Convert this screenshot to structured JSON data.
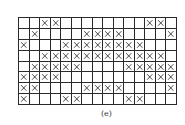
{
  "figure": {
    "caption": "(e)",
    "rows": 8,
    "cols": 15,
    "line_color": "#2a2a2a",
    "mark_icon": "x-mark-icon",
    "grid": [
      [
        0,
        0,
        1,
        1,
        0,
        0,
        0,
        0,
        0,
        0,
        0,
        0,
        1,
        1,
        0
      ],
      [
        0,
        1,
        0,
        0,
        0,
        0,
        1,
        1,
        1,
        1,
        0,
        0,
        0,
        0,
        1
      ],
      [
        1,
        0,
        0,
        0,
        1,
        1,
        1,
        1,
        1,
        1,
        1,
        1,
        0,
        0,
        0
      ],
      [
        0,
        0,
        1,
        1,
        1,
        1,
        1,
        1,
        1,
        1,
        1,
        1,
        1,
        1,
        0
      ],
      [
        0,
        1,
        1,
        1,
        1,
        1,
        0,
        0,
        0,
        0,
        1,
        1,
        1,
        1,
        1
      ],
      [
        1,
        1,
        1,
        1,
        0,
        0,
        0,
        0,
        0,
        0,
        0,
        0,
        1,
        1,
        1
      ],
      [
        1,
        1,
        0,
        0,
        0,
        0,
        1,
        1,
        1,
        1,
        0,
        0,
        0,
        0,
        1
      ],
      [
        1,
        0,
        0,
        0,
        1,
        1,
        0,
        0,
        0,
        0,
        1,
        1,
        0,
        0,
        0
      ]
    ]
  }
}
